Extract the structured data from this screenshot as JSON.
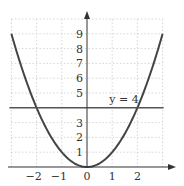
{
  "chart_data": {
    "type": "line",
    "title": "",
    "xlabel": "",
    "ylabel": "",
    "xlim": [
      -3,
      3
    ],
    "ylim": [
      0,
      10
    ],
    "grid": true,
    "x_ticks": [
      -2,
      -1,
      0,
      1,
      2
    ],
    "y_ticks": [
      1,
      2,
      3,
      5,
      6,
      7,
      8,
      9
    ],
    "series": [
      {
        "name": "y = x^2",
        "type": "curve",
        "function": "x^2",
        "x_range": [
          -3,
          3
        ],
        "color": "#444444"
      },
      {
        "name": "y = 4",
        "type": "horizontal_line",
        "y": 4,
        "color": "#555555",
        "label": "y = 4"
      }
    ],
    "annotations": [
      {
        "text": "y = 4",
        "x": 1.2,
        "y": 4.2
      }
    ],
    "intersections": [
      [
        -2,
        4
      ],
      [
        2,
        4
      ]
    ]
  },
  "colors": {
    "axis": "#333333",
    "grid": "#cccccc",
    "curve": "#444444",
    "line": "#555555"
  }
}
